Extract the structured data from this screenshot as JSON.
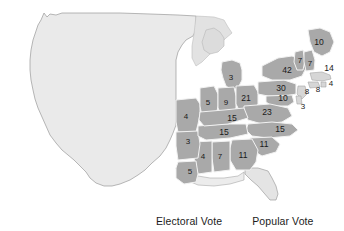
{
  "figure": {
    "type": "choropleth-map",
    "region": "United States",
    "background_color": "#ffffff"
  },
  "colors": {
    "unshaded_region": "#eaeaea",
    "shaded_state": "#a9a9a9",
    "light_state": "#d8d8d8",
    "border": "#9a9a9a",
    "inner_border": "#f2f2f2",
    "label_text": "#1a1a1a"
  },
  "legend": {
    "items": [
      {
        "label": "Electoral Vote"
      },
      {
        "label": "Popular Vote"
      }
    ]
  },
  "chart_data": {
    "type": "map",
    "title": "",
    "value_label": "Electoral Vote",
    "regions": [
      {
        "name": "Maine",
        "value": 10,
        "shaded": true,
        "x": 319,
        "y": 43
      },
      {
        "name": "Vermont",
        "value": 7,
        "shaded": true,
        "x": 300,
        "y": 61
      },
      {
        "name": "New Hampshire",
        "value": 7,
        "shaded": true,
        "x": 310,
        "y": 64
      },
      {
        "name": "Massachusetts",
        "value": 14,
        "shaded": false,
        "x": 329,
        "y": 69
      },
      {
        "name": "New York",
        "value": 42,
        "shaded": true,
        "x": 287,
        "y": 71
      },
      {
        "name": "Rhode Island",
        "value": 4,
        "shaded": false,
        "x": 331,
        "y": 84
      },
      {
        "name": "Connecticut",
        "value": 8,
        "shaded": false,
        "x": 318,
        "y": 90
      },
      {
        "name": "New Jersey",
        "value": 8,
        "shaded": false,
        "x": 307,
        "y": 92
      },
      {
        "name": "Pennsylvania",
        "value": 30,
        "shaded": true,
        "x": 281,
        "y": 89
      },
      {
        "name": "Maryland",
        "value": 10,
        "shaded": true,
        "x": 283,
        "y": 99
      },
      {
        "name": "Delaware",
        "value": 3,
        "shaded": false,
        "x": 303,
        "y": 107
      },
      {
        "name": "Virginia",
        "value": 23,
        "shaded": true,
        "x": 267,
        "y": 113
      },
      {
        "name": "North Carolina",
        "value": 15,
        "shaded": true,
        "x": 280,
        "y": 130
      },
      {
        "name": "South Carolina",
        "value": 11,
        "shaded": true,
        "x": 264,
        "y": 145
      },
      {
        "name": "Georgia",
        "value": 11,
        "shaded": true,
        "x": 243,
        "y": 156
      },
      {
        "name": "Alabama",
        "value": 7,
        "shaded": true,
        "x": 220,
        "y": 157
      },
      {
        "name": "Mississippi",
        "value": 4,
        "shaded": true,
        "x": 203,
        "y": 157
      },
      {
        "name": "Louisiana",
        "value": 5,
        "shaded": true,
        "x": 190,
        "y": 172
      },
      {
        "name": "Arkansas",
        "value": 3,
        "shaded": true,
        "x": 188,
        "y": 142
      },
      {
        "name": "Missouri",
        "value": 4,
        "shaded": true,
        "x": 186,
        "y": 117
      },
      {
        "name": "Tennessee",
        "value": 15,
        "shaded": true,
        "x": 224,
        "y": 133
      },
      {
        "name": "Kentucky",
        "value": 15,
        "shaded": true,
        "x": 232,
        "y": 119
      },
      {
        "name": "Ohio",
        "value": 21,
        "shaded": true,
        "x": 246,
        "y": 99
      },
      {
        "name": "Indiana",
        "value": 9,
        "shaded": true,
        "x": 226,
        "y": 103
      },
      {
        "name": "Illinois",
        "value": 5,
        "shaded": true,
        "x": 208,
        "y": 103
      },
      {
        "name": "Michigan",
        "value": 3,
        "shaded": true,
        "x": 231,
        "y": 78
      }
    ]
  }
}
